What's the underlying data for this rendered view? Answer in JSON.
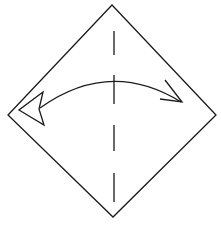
{
  "diagram": {
    "type": "origami-step",
    "colors": {
      "background": "#ffffff",
      "stroke": "#1a1a1a"
    },
    "paper": {
      "shape": "diamond",
      "vertices": {
        "top": [
          112,
          5
        ],
        "right": [
          216,
          115
        ],
        "bottom": [
          113,
          217
        ],
        "left": [
          8,
          115
        ]
      }
    },
    "fold_line": {
      "kind": "valley",
      "x": 114,
      "dashes": [
        [
          31,
          55
        ],
        [
          75,
          104
        ],
        [
          125,
          151
        ],
        [
          173,
          202
        ]
      ]
    },
    "arrow": {
      "kind": "fold-and-unfold",
      "from": [
        182,
        103
      ],
      "to": [
        38,
        109
      ],
      "control": [
        110,
        60
      ]
    }
  }
}
